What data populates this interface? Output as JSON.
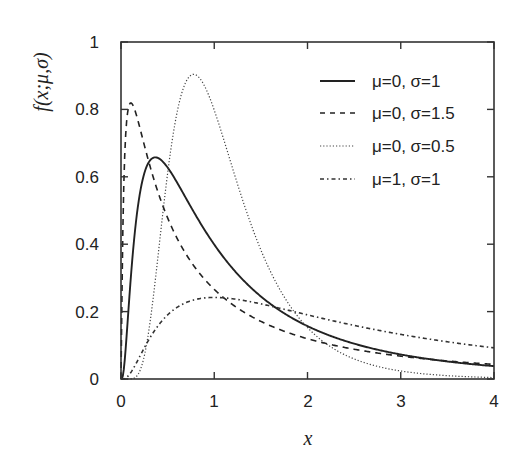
{
  "chart_data": {
    "type": "line",
    "title": "",
    "xlabel": "x",
    "ylabel": "f(x;μ,σ)",
    "xlim": [
      0,
      4
    ],
    "ylim": [
      0,
      1
    ],
    "xticks": [
      "0",
      "1",
      "2",
      "3",
      "4"
    ],
    "yticks": [
      "0",
      "0.2",
      "0.4",
      "0.6",
      "0.8",
      "1"
    ],
    "grid": false,
    "legend_position": "upper right",
    "x": [
      0.05,
      0.1,
      0.2,
      0.3,
      0.4,
      0.5,
      0.6,
      0.8,
      1.0,
      1.25,
      1.5,
      2.0,
      2.5,
      3.0,
      3.5,
      4.0
    ],
    "series": [
      {
        "name": "μ=0, σ=1",
        "style": "solid",
        "mu": 0,
        "sigma": 1,
        "values": [
          0.091,
          0.282,
          0.546,
          0.644,
          0.655,
          0.627,
          0.583,
          0.486,
          0.399,
          0.31,
          0.245,
          0.157,
          0.104,
          0.073,
          0.052,
          0.038
        ]
      },
      {
        "name": "μ=0, σ=1.5",
        "style": "dashed",
        "mu": 0,
        "sigma": 1.5,
        "values": [
          0.812,
          0.767,
          0.62,
          0.512,
          0.443,
          0.406,
          0.365,
          0.314,
          0.266,
          0.219,
          0.189,
          0.134,
          0.103,
          0.082,
          0.066,
          0.055
        ]
      },
      {
        "name": "μ=0, σ=0.5",
        "style": "dotted",
        "mu": 0,
        "sigma": 0.5,
        "values": [
          0.0,
          0.0,
          0.003,
          0.064,
          0.251,
          0.486,
          0.683,
          0.871,
          0.798,
          0.605,
          0.42,
          0.179,
          0.068,
          0.025,
          0.009,
          0.003
        ]
      },
      {
        "name": "μ=1, σ=1",
        "style": "dash-dot",
        "mu": 1,
        "sigma": 1,
        "values": [
          0.001,
          0.011,
          0.053,
          0.106,
          0.15,
          0.184,
          0.207,
          0.231,
          0.242,
          0.243,
          0.237,
          0.217,
          0.195,
          0.175,
          0.156,
          0.141
        ]
      }
    ],
    "peaks": [
      {
        "series": "μ=0, σ=1",
        "x": 0.37,
        "y": 0.66
      },
      {
        "series": "μ=0, σ=1.5",
        "x": 0.11,
        "y": 0.82
      },
      {
        "series": "μ=0, σ=0.5",
        "x": 0.78,
        "y": 0.9
      },
      {
        "series": "μ=1, σ=1",
        "x": 1.0,
        "y": 0.24
      }
    ]
  },
  "legend": {
    "items": [
      {
        "label": "μ=0, σ=1",
        "style": "solid"
      },
      {
        "label": "μ=0, σ=1.5",
        "style": "dashed"
      },
      {
        "label": "μ=0, σ=0.5",
        "style": "dotted"
      },
      {
        "label": "μ=1, σ=1",
        "style": "dash-dot"
      }
    ]
  },
  "axes": {
    "x_label": "x",
    "y_label": "f(x;μ,σ)",
    "x_ticks": [
      "0",
      "1",
      "2",
      "3",
      "4"
    ],
    "y_ticks": [
      "0",
      "0.2",
      "0.4",
      "0.6",
      "0.8",
      "1"
    ]
  },
  "colors": {
    "line": "#222222",
    "frame": "#333333",
    "background": "#ffffff"
  }
}
